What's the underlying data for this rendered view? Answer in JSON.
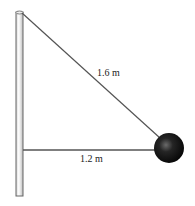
{
  "diagram": {
    "labels": {
      "diagonal_rope": "1.6 m",
      "horizontal_rope": "1.2 m"
    },
    "colors": {
      "rope": "#555555",
      "pole_edge": "#666666",
      "ball": "#111111"
    }
  }
}
